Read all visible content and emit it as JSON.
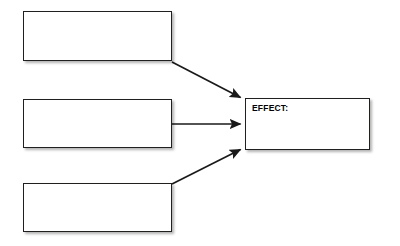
{
  "diagram": {
    "type": "cause-and-effect-graphic-organizer",
    "title": "",
    "canvas": {
      "width": 400,
      "height": 246,
      "background": "#ffffff"
    },
    "style": {
      "box_fill": "#ffffff",
      "box_border_color": "#221f1f",
      "arrow_color": "#1a1a1a",
      "text_color": "#000000"
    },
    "nodes": [
      {
        "id": "cause-1",
        "role": "cause",
        "label": "",
        "placeholder": "",
        "x": 23,
        "y": 11,
        "width": 149,
        "height": 50
      },
      {
        "id": "cause-2",
        "role": "cause",
        "label": "",
        "placeholder": "",
        "x": 23,
        "y": 99,
        "width": 149,
        "height": 49
      },
      {
        "id": "cause-3",
        "role": "cause",
        "label": "",
        "placeholder": "",
        "x": 23,
        "y": 183,
        "width": 149,
        "height": 49
      },
      {
        "id": "effect-box",
        "role": "effect",
        "label": "EFFECT:",
        "placeholder": "",
        "x": 245,
        "y": 98,
        "width": 125,
        "height": 52
      }
    ],
    "connectors": [
      {
        "id": "arrow-cause-1-to-effect",
        "from": "cause-1",
        "to": "effect-box",
        "x1": 172,
        "y1": 62,
        "x2": 243,
        "y2": 99,
        "direction": "down-right"
      },
      {
        "id": "arrow-cause-2-to-effect",
        "from": "cause-2",
        "to": "effect-box",
        "x1": 172,
        "y1": 124,
        "x2": 243,
        "y2": 124,
        "direction": "right"
      },
      {
        "id": "arrow-cause-3-to-effect",
        "from": "cause-3",
        "to": "effect-box",
        "x1": 172,
        "y1": 184,
        "x2": 243,
        "y2": 148,
        "direction": "up-right"
      }
    ]
  }
}
